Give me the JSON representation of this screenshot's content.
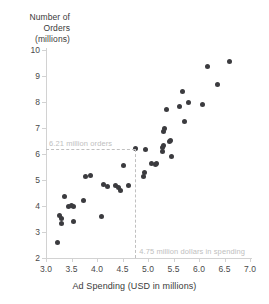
{
  "chart_data": {
    "type": "scatter",
    "title": "",
    "xlabel": "Ad Spending (USD in millions)",
    "ylabel": "Number of Orders (millions)",
    "ylabel_lines": [
      "Number of",
      "Orders",
      "(millions)"
    ],
    "xlim": [
      3.0,
      7.0
    ],
    "ylim": [
      2,
      10
    ],
    "xticks": [
      "3.0",
      "3.5",
      "4.0",
      "4.5",
      "5.0",
      "5.5",
      "6.0",
      "6.5",
      "7.0"
    ],
    "xtick_values": [
      3.0,
      3.5,
      4.0,
      4.5,
      5.0,
      5.5,
      6.0,
      6.5,
      7.0
    ],
    "yticks": [
      "2",
      "3",
      "4",
      "5",
      "6",
      "7",
      "8",
      "9",
      "10"
    ],
    "ytick_values": [
      2,
      3,
      4,
      5,
      6,
      7,
      8,
      9,
      10
    ],
    "grid": false,
    "legend": null,
    "marker_color": "#3b3b3f",
    "axis_color": "#d2d2d2",
    "annotation_color": "#c0c0c0",
    "points": [
      [
        3.22,
        2.6
      ],
      [
        3.27,
        3.62
      ],
      [
        3.3,
        3.52
      ],
      [
        3.31,
        3.34
      ],
      [
        3.37,
        4.37
      ],
      [
        3.44,
        4.0
      ],
      [
        3.5,
        4.02
      ],
      [
        3.53,
        3.99
      ],
      [
        3.54,
        3.4
      ],
      [
        3.74,
        4.22
      ],
      [
        3.78,
        5.12
      ],
      [
        3.88,
        5.17
      ],
      [
        4.09,
        3.58
      ],
      [
        4.12,
        4.83
      ],
      [
        4.21,
        4.74
      ],
      [
        4.37,
        4.78
      ],
      [
        4.43,
        4.72
      ],
      [
        4.46,
        4.6
      ],
      [
        4.52,
        5.55
      ],
      [
        4.62,
        4.8
      ],
      [
        4.75,
        6.21
      ],
      [
        4.92,
        5.13
      ],
      [
        4.94,
        5.27
      ],
      [
        4.96,
        6.17
      ],
      [
        5.06,
        5.65
      ],
      [
        5.14,
        5.58
      ],
      [
        5.17,
        5.62
      ],
      [
        5.28,
        6.1
      ],
      [
        5.29,
        6.25
      ],
      [
        5.3,
        6.33
      ],
      [
        5.31,
        6.85
      ],
      [
        5.33,
        7.0
      ],
      [
        5.36,
        7.7
      ],
      [
        5.42,
        6.48
      ],
      [
        5.45,
        6.52
      ],
      [
        5.47,
        5.9
      ],
      [
        5.62,
        7.83
      ],
      [
        5.68,
        8.42
      ],
      [
        5.72,
        7.25
      ],
      [
        5.79,
        7.98
      ],
      [
        6.06,
        7.9
      ],
      [
        6.17,
        9.35
      ],
      [
        6.36,
        8.67
      ],
      [
        6.6,
        9.55
      ]
    ],
    "annotations": [
      {
        "id": "orders-annotation",
        "text": "6.21 million orders",
        "axis": "y",
        "value": 6.21,
        "guide": "horizontal-dashed-line"
      },
      {
        "id": "spending-annotation",
        "text": "4.75 million dollars in spending",
        "axis": "x",
        "value": 4.75,
        "guide": "vertical-dashed-line"
      }
    ]
  }
}
